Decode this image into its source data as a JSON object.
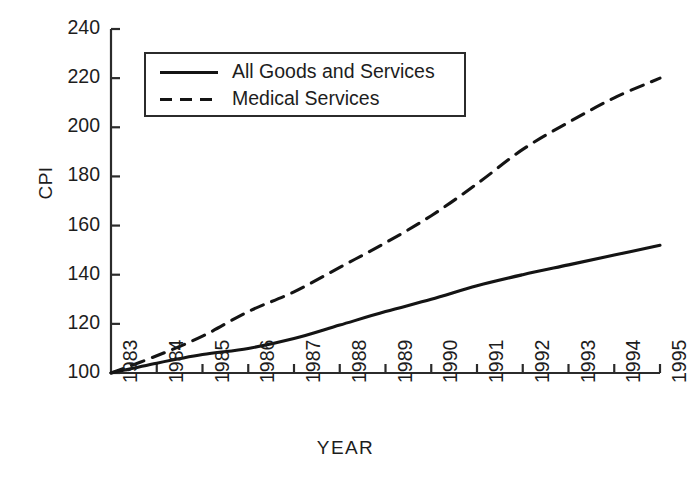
{
  "chart_data": {
    "type": "line",
    "title": "",
    "xlabel": "YEAR",
    "ylabel": "CPI",
    "grid": false,
    "legend_position": "top-left-inside",
    "x": [
      1983,
      1984,
      1985,
      1986,
      1987,
      1988,
      1989,
      1990,
      1991,
      1992,
      1993,
      1994,
      1995
    ],
    "xtick_labels": [
      "1983",
      "1984",
      "1985",
      "1986",
      "1987",
      "1988",
      "1989",
      "1990",
      "1991",
      "1992",
      "1993",
      "1994",
      "1995"
    ],
    "ytick_labels": [
      "100",
      "120",
      "140",
      "160",
      "180",
      "200",
      "220",
      "240"
    ],
    "ytick_values": [
      100,
      120,
      140,
      160,
      180,
      200,
      220,
      240
    ],
    "xlim": [
      1983,
      1995
    ],
    "ylim": [
      100,
      240
    ],
    "series": [
      {
        "name": "All Goods and Services",
        "style": "solid",
        "color": "#141414",
        "values": [
          100,
          104,
          107.5,
          110,
          114,
          119.5,
          125,
          130,
          135.5,
          140,
          144,
          148,
          152
        ]
      },
      {
        "name": "Medical Services",
        "style": "dashed",
        "color": "#141414",
        "values": [
          100,
          107,
          115,
          125,
          133,
          143,
          153,
          164,
          177,
          191,
          202,
          212,
          220
        ]
      }
    ]
  },
  "legend": {
    "entries": [
      {
        "label": "All Goods and Services",
        "style": "solid"
      },
      {
        "label": "Medical Services",
        "style": "dashed"
      }
    ]
  },
  "axes": {
    "y_title": "CPI",
    "x_title": "YEAR"
  }
}
